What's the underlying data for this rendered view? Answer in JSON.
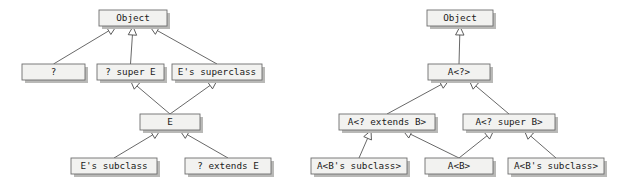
{
  "diagram": {
    "type": "uml-class-inheritance",
    "title": "",
    "background_color": "#ffffff",
    "box_fill_color": "#f2f2f0",
    "box_border_color": "#6e6e6e",
    "box_shadow_color": "#b9b9b7",
    "edge_color": "#575757",
    "arrowhead_style": "hollow-triangle-generalization",
    "panels": [
      {
        "id": "left-panel",
        "name": "wildcard-type-hierarchy",
        "nodes": [
          {
            "id": "L1",
            "label": "Object",
            "x": 99,
            "y": 10,
            "w": 68,
            "h": 16
          },
          {
            "id": "L2",
            "label": "?",
            "x": 22,
            "y": 64,
            "w": 63,
            "h": 16
          },
          {
            "id": "L3",
            "label": "? super E",
            "x": 97,
            "y": 64,
            "w": 67,
            "h": 16
          },
          {
            "id": "L4",
            "label": "E's superclass",
            "x": 172,
            "y": 64,
            "w": 90,
            "h": 16
          },
          {
            "id": "L5",
            "label": "E",
            "x": 140,
            "y": 114,
            "w": 60,
            "h": 16
          },
          {
            "id": "L6",
            "label": "E's subclass",
            "x": 71,
            "y": 158,
            "w": 86,
            "h": 16
          },
          {
            "id": "L7",
            "label": "? extends E",
            "x": 185,
            "y": 158,
            "w": 86,
            "h": 16
          }
        ],
        "edges": [
          {
            "from": "L2",
            "to": "L1",
            "relation": "generalization"
          },
          {
            "from": "L3",
            "to": "L1",
            "relation": "generalization"
          },
          {
            "from": "L4",
            "to": "L1",
            "relation": "generalization"
          },
          {
            "from": "L5",
            "to": "L3",
            "relation": "generalization"
          },
          {
            "from": "L5",
            "to": "L4",
            "relation": "generalization"
          },
          {
            "from": "L6",
            "to": "L5",
            "relation": "generalization"
          },
          {
            "from": "L7",
            "to": "L5",
            "relation": "generalization"
          }
        ]
      },
      {
        "id": "right-panel",
        "name": "generic-type-wildcard-hierarchy",
        "nodes": [
          {
            "id": "R1",
            "label": "Object",
            "x": 427,
            "y": 10,
            "w": 66,
            "h": 16
          },
          {
            "id": "R2",
            "label": "A<?>",
            "x": 428,
            "y": 64,
            "w": 62,
            "h": 16
          },
          {
            "id": "R3",
            "label": "A<? extends B>",
            "x": 339,
            "y": 114,
            "w": 96,
            "h": 16
          },
          {
            "id": "R4",
            "label": "A<? super B>",
            "x": 463,
            "y": 114,
            "w": 92,
            "h": 16
          },
          {
            "id": "R5",
            "label": "A<B's subclass>",
            "x": 311,
            "y": 158,
            "w": 96,
            "h": 16
          },
          {
            "id": "R6",
            "label": "A<B>",
            "x": 425,
            "y": 158,
            "w": 68,
            "h": 16
          },
          {
            "id": "R7",
            "label": "A<B's subclass>",
            "x": 508,
            "y": 158,
            "w": 96,
            "h": 16
          }
        ],
        "edges": [
          {
            "from": "R2",
            "to": "R1",
            "relation": "generalization"
          },
          {
            "from": "R3",
            "to": "R2",
            "relation": "generalization"
          },
          {
            "from": "R4",
            "to": "R2",
            "relation": "generalization"
          },
          {
            "from": "R5",
            "to": "R3",
            "relation": "generalization"
          },
          {
            "from": "R6",
            "to": "R3",
            "relation": "generalization"
          },
          {
            "from": "R6",
            "to": "R4",
            "relation": "generalization"
          },
          {
            "from": "R7",
            "to": "R4",
            "relation": "generalization"
          }
        ]
      }
    ]
  }
}
